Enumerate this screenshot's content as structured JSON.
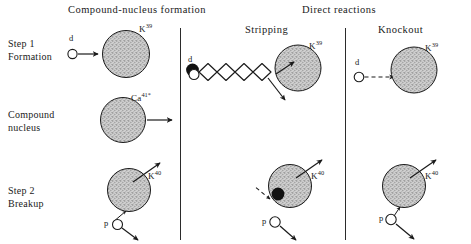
{
  "figure": {
    "background_color": "#ffffff",
    "ink_color": "#1a1a1a",
    "nucleus_fill": "#c9c9c9",
    "width": 471,
    "height": 244
  },
  "headers": {
    "left": "Compound-nucleus formation",
    "right_group": "Direct reactions",
    "stripping": "Stripping",
    "knockout": "Knockout"
  },
  "row_labels": [
    {
      "line1": "Step 1",
      "line2": "Formation"
    },
    {
      "line1": "Compound",
      "line2": "nucleus"
    },
    {
      "line1": "Step 2",
      "line2": "Breakup"
    }
  ],
  "nuclei": {
    "k39": "K",
    "k39_mass": "39",
    "ca41": "Ca",
    "ca41_mass": "41*",
    "k40": "K",
    "k40_mass": "40"
  },
  "particles": {
    "deuteron": "d",
    "proton": "p"
  },
  "panels": {
    "compound": {
      "step1": {
        "projectile": "d",
        "target": "K",
        "target_mass": "39",
        "arrow": "solid"
      },
      "compound": {
        "nucleus": "Ca",
        "nucleus_mass": "41*",
        "arrow": "solid"
      },
      "step2": {
        "residual": "K",
        "residual_mass": "40",
        "emitted": "p"
      }
    },
    "stripping": {
      "step1": {
        "projectile": "d",
        "target": "K",
        "target_mass": "39",
        "path": "wavy"
      },
      "step2": {
        "residual": "K",
        "residual_mass": "40",
        "emitted": "p",
        "captured_nucleon": "neutron",
        "arrow": "dashed"
      }
    },
    "knockout": {
      "step1": {
        "projectile": "d",
        "target": "K",
        "target_mass": "39",
        "arrow": "dashed"
      },
      "step2": {
        "residual": "K",
        "residual_mass": "40",
        "emitted": "p"
      }
    }
  }
}
